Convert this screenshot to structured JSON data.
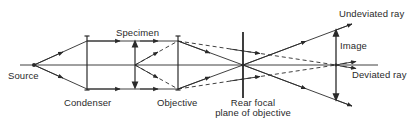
{
  "diagram": {
    "labels": {
      "source": "Source",
      "condenser": "Condenser",
      "specimen": "Specimen",
      "objective": "Objective",
      "rear_focal_line1": "Rear focal",
      "rear_focal_line2": "plane of objective",
      "image": "Image",
      "undeviated_ray": "Undeviated ray",
      "deviated_ray": "Deviated ray"
    },
    "elements": [
      {
        "id": "source",
        "type": "point",
        "x": 34,
        "y": 65
      },
      {
        "id": "condenser",
        "type": "lens",
        "x": 87,
        "y_top": 36,
        "y_bottom": 90
      },
      {
        "id": "specimen",
        "type": "arrow",
        "x": 135,
        "y_top": 41,
        "y_bottom": 88
      },
      {
        "id": "objective",
        "type": "lens",
        "x": 178,
        "y_top": 36,
        "y_bottom": 90
      },
      {
        "id": "rear_focal_plane",
        "type": "plane",
        "x": 243,
        "y_top": 32,
        "y_bottom": 98
      },
      {
        "id": "image",
        "type": "arrow",
        "x": 336,
        "y_top": 30,
        "y_bottom": 100
      }
    ],
    "rays": {
      "undeviated": "solid",
      "deviated": "dashed"
    },
    "colors": {
      "line": "#2a2a2a",
      "background": "#ffffff"
    }
  }
}
